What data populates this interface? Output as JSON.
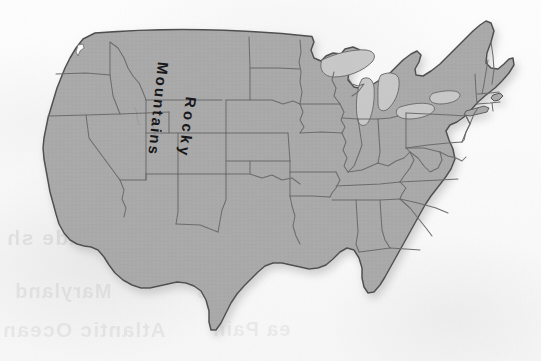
{
  "image": {
    "kind": "scanned-map",
    "subject": "Contiguous United States",
    "width": 541,
    "height": 361
  },
  "map": {
    "title_labels": {
      "rocky": "Rocky",
      "mountains": "Mountains"
    },
    "colors": {
      "land_fill": "#a9a9a9",
      "land_fill_dark": "#9d9d9d",
      "lake_fill": "#c6c6c6",
      "outline": "#4a4a4a",
      "state_border": "#6e6e6e",
      "background": "#fbfbfb",
      "label_text": "#18181a",
      "shadow": "#d8d8d8"
    },
    "legend": [],
    "regions_depicted": [
      "Pacific Northwest",
      "California",
      "Great Basin",
      "Rocky Mountains",
      "Great Plains",
      "Midwest",
      "Great Lakes",
      "Northeast",
      "Southeast",
      "Gulf Coast",
      "Florida",
      "Texas"
    ]
  },
  "bleed_through": {
    "note": "faint mirrored show-through text from the reverse side of the page",
    "lines": [
      "els: shade sh",
      "Maryland",
      "Atlantic Ocean",
      "ea Pain",
      "n s"
    ]
  }
}
